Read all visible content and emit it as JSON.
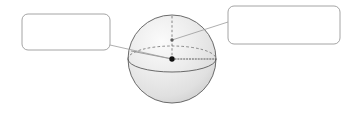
{
  "figure": {
    "name": "labeled-sphere-diagram",
    "type": "geometry-diagram",
    "background_color": "#ffffff",
    "width": 354,
    "height": 113
  },
  "sphere": {
    "name": "sphere",
    "center_x": 172,
    "center_y": 59,
    "radius": 44,
    "outline_color": "#555555",
    "fill_light": "#f4f4f4",
    "fill_mid": "#e6e6e6",
    "fill_dark": "#d2d2d2",
    "equator": {
      "name": "equator-ellipse",
      "rx": 44,
      "ry": 13,
      "cy": 59,
      "back_style": "dashed",
      "front_style": "solid",
      "stroke_color": "#6b6b6b"
    },
    "polar_axis": {
      "name": "polar-axis",
      "style": "dashed",
      "stroke_color": "#6b6b6b",
      "from_y": 16,
      "to_y": 59
    },
    "radius_line_horizontal": {
      "name": "equatorial-radius",
      "style": "dotted",
      "stroke_color": "#4a4a4a"
    },
    "center_point": {
      "name": "center-point",
      "color": "#111111",
      "radius": 2.6
    },
    "axis_point": {
      "name": "axis-point",
      "color": "#555555",
      "radius": 1.6,
      "x": 172,
      "y": 40
    }
  },
  "callouts": [
    {
      "id": "left",
      "name": "callout-box-left",
      "label": "",
      "x": 22,
      "y": 14,
      "width": 88,
      "height": 36,
      "corner_radius": 6,
      "border_color": "#9a9a9a",
      "fill_color": "#ffffff",
      "leader": {
        "name": "leader-line-left",
        "stroke_color": "#9a9a9a",
        "from_x": 110,
        "from_y": 45,
        "to_x": 172,
        "to_y": 59
      }
    },
    {
      "id": "right",
      "name": "callout-box-right",
      "label": "",
      "x": 228,
      "y": 6,
      "width": 112,
      "height": 38,
      "corner_radius": 6,
      "border_color": "#9a9a9a",
      "fill_color": "#ffffff",
      "leader": {
        "name": "leader-line-right",
        "stroke_color": "#9a9a9a",
        "from_x": 228,
        "from_y": 22,
        "to_x": 172,
        "to_y": 40
      }
    }
  ]
}
